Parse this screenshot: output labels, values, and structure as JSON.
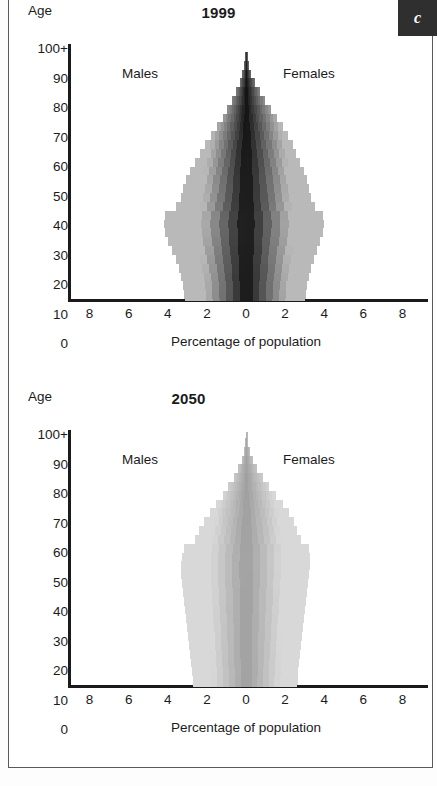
{
  "badge": {
    "label": "c"
  },
  "axis": {
    "age_caption": "Age",
    "y_ticks": [
      "100+",
      "90",
      "80",
      "70",
      "60",
      "50",
      "40",
      "30",
      "20",
      "10",
      "0"
    ],
    "x_ticks": [
      "8",
      "6",
      "4",
      "2",
      "0",
      "2",
      "4",
      "6",
      "8"
    ],
    "x_title": "Percentage of population"
  },
  "labels": {
    "males": "Males",
    "females": "Females"
  },
  "colors": {
    "axis": "#1b1b1b",
    "badge_bg": "#2f2f2f",
    "badge_fg": "#ffffff",
    "frame": "#5a5a5a",
    "pyramid_1999_center": "#0d0d0d",
    "pyramid_1999_edge": "#b9b9b9",
    "pyramid_2050_center": "#9d9d9d",
    "pyramid_2050_edge": "#d8d8d8"
  },
  "chart_data": [
    {
      "type": "bar",
      "title": "1999",
      "subtitle": "",
      "orientation": "population-pyramid",
      "xlabel": "Percentage of population",
      "ylabel": "Age",
      "xlim": [
        -9,
        9
      ],
      "x_ticks": [
        8,
        6,
        4,
        2,
        0,
        2,
        4,
        6,
        8
      ],
      "ylim": [
        15,
        102
      ],
      "y_ticks": [
        0,
        10,
        20,
        30,
        40,
        50,
        60,
        70,
        80,
        90,
        100
      ],
      "grid": false,
      "legend": "in-plot",
      "categories": [
        15,
        18,
        21,
        24,
        27,
        30,
        33,
        36,
        39,
        42,
        45,
        48,
        51,
        54,
        57,
        60,
        63,
        66,
        69,
        72,
        75,
        78,
        81,
        84,
        87,
        90,
        93,
        96,
        99,
        101
      ],
      "series": [
        {
          "name": "Males",
          "values": [
            3.1,
            3.15,
            3.2,
            3.3,
            3.45,
            3.6,
            3.8,
            4.0,
            4.15,
            4.2,
            4.15,
            3.6,
            3.35,
            3.2,
            3.05,
            2.85,
            2.6,
            2.35,
            2.1,
            1.8,
            1.5,
            1.2,
            0.95,
            0.7,
            0.5,
            0.32,
            0.18,
            0.1,
            0.05,
            0.02
          ]
        },
        {
          "name": "Females",
          "values": [
            3.0,
            3.05,
            3.1,
            3.2,
            3.3,
            3.45,
            3.6,
            3.75,
            3.9,
            3.95,
            3.9,
            3.5,
            3.3,
            3.2,
            3.1,
            2.95,
            2.75,
            2.55,
            2.35,
            2.1,
            1.85,
            1.55,
            1.25,
            0.95,
            0.7,
            0.45,
            0.25,
            0.13,
            0.06,
            0.02
          ]
        }
      ]
    },
    {
      "type": "bar",
      "title": "2050",
      "subtitle": "",
      "orientation": "population-pyramid",
      "xlabel": "Percentage of population",
      "ylabel": "Age",
      "xlim": [
        -9,
        9
      ],
      "x_ticks": [
        8,
        6,
        4,
        2,
        0,
        2,
        4,
        6,
        8
      ],
      "ylim": [
        15,
        102
      ],
      "y_ticks": [
        0,
        10,
        20,
        30,
        40,
        50,
        60,
        70,
        80,
        90,
        100
      ],
      "grid": false,
      "legend": "in-plot",
      "categories": [
        15,
        18,
        21,
        24,
        27,
        30,
        33,
        36,
        39,
        42,
        45,
        48,
        51,
        54,
        57,
        60,
        63,
        66,
        69,
        72,
        75,
        78,
        81,
        84,
        87,
        90,
        93,
        96,
        99,
        101
      ],
      "series": [
        {
          "name": "Males",
          "values": [
            2.7,
            2.72,
            2.75,
            2.8,
            2.85,
            2.9,
            2.95,
            3.0,
            3.05,
            3.1,
            3.15,
            3.2,
            3.25,
            3.3,
            3.3,
            3.25,
            3.15,
            2.6,
            2.4,
            2.15,
            1.85,
            1.55,
            1.2,
            0.9,
            0.62,
            0.4,
            0.22,
            0.12,
            0.06,
            0.02
          ]
        },
        {
          "name": "Females",
          "values": [
            2.6,
            2.62,
            2.65,
            2.7,
            2.75,
            2.8,
            2.85,
            2.9,
            2.95,
            3.0,
            3.05,
            3.1,
            3.15,
            3.2,
            3.25,
            3.25,
            3.2,
            2.8,
            2.6,
            2.4,
            2.15,
            1.85,
            1.5,
            1.15,
            0.85,
            0.55,
            0.32,
            0.17,
            0.08,
            0.03
          ]
        }
      ]
    }
  ]
}
